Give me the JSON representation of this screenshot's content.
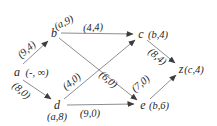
{
  "figure": {
    "background": "#ffffff",
    "edge_color": "#8e8e8e",
    "arrow_color": "#3c3c3c",
    "text_color": "#1f1f1f",
    "nodes": [
      {
        "id": "a",
        "label": "a",
        "annotation": "(-, ∞)",
        "x": 17,
        "y": 72,
        "ann_x": 37,
        "ann_y": 73,
        "ann_rot": 0
      },
      {
        "id": "b",
        "label": "b",
        "annotation": "(a,9)",
        "x": 54,
        "y": 33,
        "ann_x": 64,
        "ann_y": 23,
        "ann_rot": -26
      },
      {
        "id": "c",
        "label": "c",
        "annotation": "(b,4)",
        "x": 141,
        "y": 34,
        "ann_x": 158,
        "ann_y": 35,
        "ann_rot": 0
      },
      {
        "id": "d",
        "label": "d",
        "annotation": "(a,8)",
        "x": 57,
        "y": 105,
        "ann_x": 57,
        "ann_y": 117,
        "ann_rot": 0
      },
      {
        "id": "e",
        "label": "e",
        "annotation": "(b,6)",
        "x": 143,
        "y": 105,
        "ann_x": 159,
        "ann_y": 106,
        "ann_rot": 0
      },
      {
        "id": "z",
        "label": "z",
        "annotation": "(c,4)",
        "x": 181,
        "y": 69,
        "ann_x": 194,
        "ann_y": 70,
        "ann_rot": 0
      }
    ],
    "edges": [
      {
        "from": "a",
        "to": "b",
        "label": "(9,4)",
        "x1": 23,
        "y1": 64,
        "x2": 48,
        "y2": 41,
        "label_x": 27,
        "label_y": 50,
        "label_rot": -41
      },
      {
        "from": "a",
        "to": "d",
        "label": "(8,0)",
        "x1": 23,
        "y1": 80,
        "x2": 51,
        "y2": 99,
        "label_x": 21,
        "label_y": 91,
        "label_rot": 40
      },
      {
        "from": "b",
        "to": "c",
        "label": "(4,4)",
        "x1": 61,
        "y1": 33,
        "x2": 133,
        "y2": 34,
        "label_x": 93,
        "label_y": 28,
        "label_rot": -4
      },
      {
        "from": "b",
        "to": "e",
        "label": "(6,0)",
        "x1": 59,
        "y1": 38,
        "x2": 137,
        "y2": 100,
        "label_x": 108,
        "label_y": 80,
        "label_rot": 39
      },
      {
        "from": "d",
        "to": "c",
        "label": "(4,0)",
        "x1": 64,
        "y1": 99,
        "x2": 135,
        "y2": 40,
        "label_x": 72,
        "label_y": 82,
        "label_rot": -39
      },
      {
        "from": "d",
        "to": "e",
        "label": "(9,0)",
        "x1": 67,
        "y1": 105,
        "x2": 134,
        "y2": 104,
        "label_x": 90,
        "label_y": 114,
        "label_rot": -3
      },
      {
        "from": "c",
        "to": "z",
        "label": "(8,4)",
        "x1": 147,
        "y1": 40,
        "x2": 175,
        "y2": 63,
        "label_x": 157,
        "label_y": 57,
        "label_rot": 40
      },
      {
        "from": "e",
        "to": "z",
        "label": "(7,0)",
        "x1": 150,
        "y1": 99,
        "x2": 176,
        "y2": 75,
        "label_x": 141,
        "label_y": 84,
        "label_rot": -40
      }
    ]
  }
}
